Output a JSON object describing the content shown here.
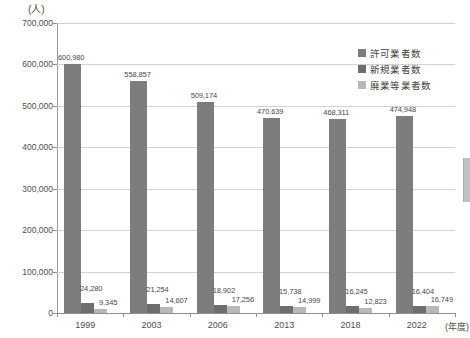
{
  "chart_data": {
    "type": "bar",
    "title": "",
    "subtitle": "",
    "unit_label": "(人)",
    "xlabel": "(年度)",
    "ylabel": "",
    "ylim": [
      0,
      700000
    ],
    "ytick_step": 100000,
    "grid": true,
    "legend_position": "top-right",
    "categories": [
      "1999",
      "2003",
      "2006",
      "2013",
      "2018",
      "2022"
    ],
    "ytick_labels": [
      "700,000",
      "600,000",
      "500,000",
      "400,000",
      "300,000",
      "200,000",
      "100,000",
      "0"
    ],
    "ytick_values": [
      700000,
      600000,
      500000,
      400000,
      300000,
      200000,
      100000,
      0
    ],
    "series": [
      {
        "name": "許可業者数",
        "color": "#7d7d7d",
        "values": [
          600980,
          558857,
          509174,
          470639,
          468311,
          474948
        ],
        "labels": [
          "600,980",
          "558,857",
          "509,174",
          "470,639",
          "468,311",
          "474,948"
        ]
      },
      {
        "name": "新規業者数",
        "color": "#6e6e6e",
        "values": [
          24280,
          21254,
          18902,
          15738,
          16245,
          16404
        ],
        "labels": [
          "24,280",
          "21,254",
          "18,902",
          "15,738",
          "16,245",
          "16,404"
        ]
      },
      {
        "name": "廃業等業者数",
        "color": "#b8b8b8",
        "values": [
          9345,
          14607,
          17256,
          14999,
          12823,
          16749
        ],
        "labels": [
          "9,345",
          "14,607",
          "17,256",
          "14,999",
          "12,823",
          "16,749"
        ]
      }
    ]
  },
  "legend": {
    "items": [
      {
        "label": "許可業者数",
        "color": "#7d7d7d"
      },
      {
        "label": "新規業者数",
        "color": "#6e6e6e"
      },
      {
        "label": "廃業等業者数",
        "color": "#b8b8b8"
      }
    ]
  },
  "axes": {
    "y_unit": "(人)",
    "x_unit": "(年度)"
  },
  "colors": {
    "licensed": "#7d7d7d",
    "new": "#6e6e6e",
    "closed": "#b8b8b8",
    "grid": "#d2d2d2",
    "axis": "#8f8f8f",
    "text": "#4a4a4a",
    "background": "#ffffff"
  }
}
